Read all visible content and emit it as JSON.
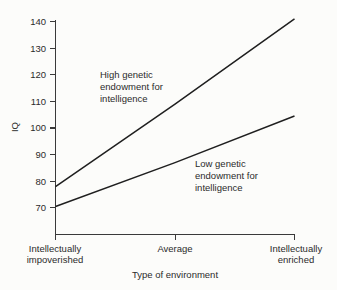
{
  "chart_data": {
    "type": "line",
    "title": "",
    "subtitle": "",
    "xlabel": "Type of environment",
    "ylabel": "IQ",
    "categories": [
      "Intellectually impoverished",
      "Average",
      "Intellectually enriched"
    ],
    "x": [
      0,
      1,
      2
    ],
    "xlim": [
      0,
      2
    ],
    "ylim": [
      63,
      145
    ],
    "yticks": [
      70,
      80,
      90,
      100,
      110,
      120,
      130,
      140
    ],
    "ytick_labels": [
      "70",
      "80",
      "90",
      "100",
      "110",
      "120",
      "130",
      "140"
    ],
    "xtick_labels": [
      "Intellectually impoverished",
      "Average",
      "Intellectually enriched"
    ],
    "grid": false,
    "legend": "inline-annotations",
    "series": [
      {
        "name": "High genetic endowment for intelligence",
        "values": [
          78,
          109,
          141
        ],
        "color": "#1f1f1f"
      },
      {
        "name": "Low genetic endowment for intelligence",
        "values": [
          70.5,
          87,
          104.5
        ],
        "color": "#1f1f1f"
      }
    ],
    "annotations": [
      {
        "id": "high-annotation",
        "lines": [
          "High genetic",
          "endowment for",
          "intelligence"
        ],
        "x": 0.38,
        "y": 120
      },
      {
        "id": "low-annotation",
        "lines": [
          "Low genetic",
          "endowment for",
          "intelligence"
        ],
        "x": 1.22,
        "y": 88
      }
    ]
  },
  "axes": {
    "y_title": "IQ",
    "x_title": "Type of environment",
    "y_tick_70": "70",
    "y_tick_80": "80",
    "y_tick_90": "90",
    "y_tick_100": "100",
    "y_tick_110": "110",
    "y_tick_120": "120",
    "y_tick_130": "130",
    "y_tick_140": "140"
  },
  "x_labels": {
    "left_line1": "Intellectually",
    "left_line2": "impoverished",
    "middle": "Average",
    "right_line1": "Intellectually",
    "right_line2": "enriched"
  },
  "annotations": {
    "high_line1": "High genetic",
    "high_line2": "endowment for",
    "high_line3": "intelligence",
    "low_line1": "Low genetic",
    "low_line2": "endowment for",
    "low_line3": "intelligence"
  },
  "colors": {
    "background": "#fcfcfa",
    "ink": "#2b2b2b",
    "line": "#1f1f1f",
    "axis": "#3a3a3a"
  }
}
